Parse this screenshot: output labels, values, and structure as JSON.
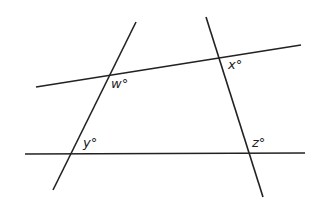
{
  "diagram": {
    "type": "geometry-angles",
    "stroke_color": "#222222",
    "background_color": "#ffffff",
    "lines": [
      {
        "id": "upper-line",
        "x1": 36,
        "y1": 87,
        "x2": 301,
        "y2": 45
      },
      {
        "id": "lower-line",
        "x1": 25,
        "y1": 154,
        "x2": 305,
        "y2": 153
      },
      {
        "id": "left-transversal",
        "x1": 136,
        "y1": 22,
        "x2": 53,
        "y2": 190
      },
      {
        "id": "right-transversal",
        "x1": 206,
        "y1": 17,
        "x2": 263,
        "y2": 197
      }
    ],
    "angle_labels": [
      {
        "id": "w",
        "text": "w°",
        "x": 111,
        "y": 88
      },
      {
        "id": "x",
        "text": "x°",
        "x": 228,
        "y": 69
      },
      {
        "id": "y",
        "text": "y°",
        "x": 83,
        "y": 147
      },
      {
        "id": "z",
        "text": "z°",
        "x": 252,
        "y": 147
      }
    ]
  }
}
